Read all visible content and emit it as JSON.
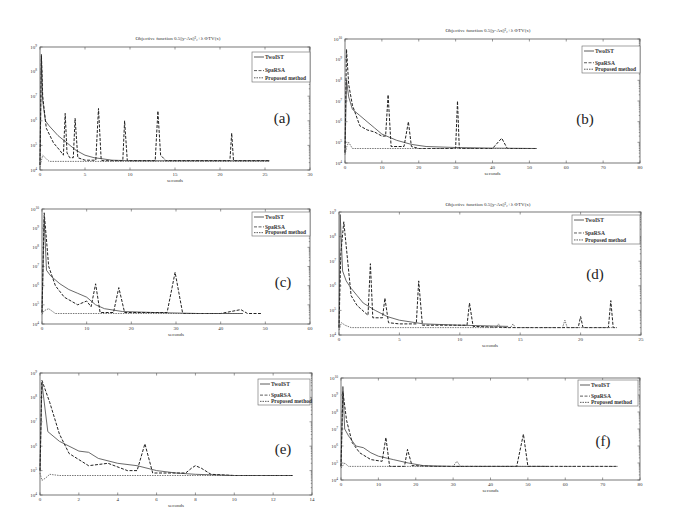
{
  "figure": {
    "legend_entries": [
      "TwoIST",
      "SpaRSA",
      "Proposed method"
    ]
  },
  "chart_data": [
    {
      "type": "line",
      "panel": "(a)",
      "title": "Objective function 0.5||y-Ax||²₂+λ ΦTV(x)",
      "xlabel": "seconds",
      "ylabel": "",
      "xlim": [
        0,
        30
      ],
      "ylim_exp": [
        4,
        9
      ],
      "yscale": "log",
      "xticks": [
        0,
        5,
        10,
        15,
        20,
        25,
        30
      ],
      "yticks_exp": [
        4,
        5,
        6,
        7,
        8,
        9
      ],
      "legend": "top-right",
      "series": [
        {
          "name": "TwoIST",
          "x": [
            0,
            0.15,
            0.3,
            0.6,
            1,
            2,
            3,
            4,
            5,
            6,
            7,
            8,
            10,
            14,
            20,
            25.5
          ],
          "y_exp": [
            4.2,
            8.6,
            6.8,
            6.0,
            5.8,
            5.4,
            5.1,
            4.8,
            4.6,
            4.5,
            4.45,
            4.4,
            4.38,
            4.38,
            4.38,
            4.38
          ]
        },
        {
          "name": "SpaRSA",
          "x": [
            0,
            0.15,
            0.3,
            0.7,
            1.5,
            2.2,
            2.6,
            2.8,
            3.0,
            3.3,
            3.7,
            3.9,
            4.2,
            5,
            6.2,
            6.5,
            6.8,
            7.0,
            9.2,
            9.4,
            9.7,
            12.8,
            13.1,
            13.4,
            14,
            21.1,
            21.3,
            21.5,
            25.5
          ],
          "y_exp": [
            4.2,
            8.7,
            7.0,
            5.7,
            5.1,
            4.8,
            4.6,
            6.3,
            4.7,
            4.5,
            4.5,
            6.1,
            4.5,
            4.4,
            4.4,
            6.5,
            4.4,
            4.38,
            4.38,
            6.0,
            4.38,
            4.38,
            6.4,
            4.6,
            4.38,
            4.38,
            5.5,
            4.38,
            4.38
          ]
        },
        {
          "name": "Proposed method",
          "x": [
            0,
            0.1,
            0.3,
            1,
            3,
            6,
            10,
            15,
            20,
            25.5
          ],
          "y_exp": [
            4.1,
            4.3,
            4.6,
            4.35,
            4.35,
            4.35,
            4.35,
            4.35,
            4.35,
            4.35
          ]
        }
      ]
    },
    {
      "type": "line",
      "panel": "(b)",
      "title": "Objective function 0.5||y-Ax||²₂+λ ΦTV(x)",
      "xlabel": "seconds",
      "ylabel": "",
      "xlim": [
        0,
        80
      ],
      "ylim_exp": [
        4,
        10
      ],
      "yscale": "log",
      "xticks": [
        0,
        10,
        20,
        30,
        40,
        50,
        60,
        70,
        80
      ],
      "yticks_exp": [
        4,
        5,
        6,
        7,
        8,
        9,
        10
      ],
      "legend": "top-right",
      "series": [
        {
          "name": "TwoIST",
          "x": [
            0,
            0.4,
            1,
            2,
            4,
            6,
            8,
            10,
            14,
            18,
            22,
            30,
            40,
            52
          ],
          "y_exp": [
            4.5,
            8.0,
            7.2,
            6.6,
            6.3,
            6.0,
            5.7,
            5.4,
            5.1,
            4.9,
            4.8,
            4.75,
            4.72,
            4.7
          ]
        },
        {
          "name": "SpaRSA",
          "x": [
            0,
            0.4,
            1,
            2,
            4,
            6,
            8,
            10,
            11,
            11.7,
            12.5,
            16,
            17.2,
            18,
            20,
            30,
            30.5,
            31,
            40,
            42.5,
            44,
            52
          ],
          "y_exp": [
            4.5,
            9.5,
            7.8,
            6.8,
            5.8,
            5.6,
            5.5,
            5.3,
            5.3,
            7.3,
            4.8,
            4.8,
            6.0,
            4.8,
            4.7,
            4.7,
            7.0,
            4.7,
            4.7,
            5.2,
            4.7,
            4.7
          ]
        },
        {
          "name": "Proposed method",
          "x": [
            0,
            0.5,
            1,
            2,
            5,
            10,
            20,
            30,
            40,
            52
          ],
          "y_exp": [
            4.4,
            4.8,
            5.0,
            4.7,
            4.7,
            4.7,
            4.7,
            4.7,
            4.7,
            4.7
          ]
        }
      ]
    },
    {
      "type": "line",
      "panel": "(c)",
      "title": "",
      "xlabel": "seconds",
      "ylabel": "",
      "xlim": [
        0,
        60
      ],
      "ylim_exp": [
        4,
        10
      ],
      "yscale": "log",
      "xticks": [
        0,
        10,
        20,
        30,
        40,
        50,
        60
      ],
      "yticks_exp": [
        4,
        5,
        6,
        7,
        8,
        9,
        10
      ],
      "legend": "top-right",
      "series": [
        {
          "name": "TwoIST",
          "x": [
            0,
            0.5,
            1,
            2,
            4,
            6,
            8,
            10,
            12,
            14,
            18,
            25,
            35,
            45
          ],
          "y_exp": [
            4.6,
            9.5,
            6.8,
            6.5,
            6.1,
            5.8,
            5.6,
            5.4,
            5.0,
            4.8,
            4.65,
            4.6,
            4.55,
            4.55
          ]
        },
        {
          "name": "SpaRSA",
          "x": [
            0,
            0.5,
            1.5,
            3,
            5,
            8,
            10,
            11,
            12,
            13,
            16,
            17.2,
            18.5,
            28,
            29.8,
            31.5,
            40,
            44.5,
            46,
            49
          ],
          "y_exp": [
            4.6,
            9.8,
            7.0,
            6.0,
            5.4,
            5.0,
            5.2,
            4.9,
            6.1,
            4.6,
            4.6,
            5.9,
            4.6,
            4.6,
            6.7,
            4.55,
            4.55,
            4.75,
            4.55,
            4.55
          ]
        },
        {
          "name": "Proposed method",
          "x": [
            0,
            0.5,
            1.5,
            3,
            10,
            20,
            30,
            40,
            45
          ],
          "y_exp": [
            4.5,
            4.7,
            4.8,
            4.55,
            4.55,
            4.55,
            4.55,
            4.55,
            4.55
          ]
        }
      ]
    },
    {
      "type": "line",
      "panel": "(d)",
      "title": "Objective function 0.5||y-Ax||²₂+λ ΦTV(x)",
      "xlabel": "seconds",
      "ylabel": "",
      "xlim": [
        0,
        25
      ],
      "ylim_exp": [
        4,
        9
      ],
      "yscale": "log",
      "xticks": [
        0,
        5,
        10,
        15,
        20,
        25
      ],
      "yticks_exp": [
        4,
        5,
        6,
        7,
        8,
        9
      ],
      "legend": "top-right",
      "series": [
        {
          "name": "TwoIST",
          "x": [
            0,
            0.1,
            0.3,
            0.6,
            1,
            1.5,
            2,
            3,
            4,
            5,
            7,
            10,
            14
          ],
          "y_exp": [
            4.3,
            8.9,
            6.6,
            6.2,
            5.9,
            5.6,
            5.3,
            5.0,
            4.75,
            4.6,
            4.45,
            4.4,
            4.35
          ]
        },
        {
          "name": "SpaRSA",
          "x": [
            0,
            0.15,
            0.4,
            1,
            1.5,
            2.4,
            2.6,
            2.8,
            3.6,
            3.8,
            4.1,
            5,
            6.4,
            6.6,
            6.9,
            10.6,
            10.8,
            11.1,
            14,
            19.8,
            20,
            20.2,
            22.3,
            22.5,
            22.7,
            23
          ],
          "y_exp": [
            4.3,
            7.3,
            8.6,
            5.6,
            5.2,
            4.8,
            6.9,
            4.7,
            4.7,
            5.5,
            4.5,
            4.45,
            4.45,
            6.2,
            4.4,
            4.4,
            5.3,
            4.35,
            4.3,
            4.3,
            4.75,
            4.3,
            4.3,
            5.4,
            4.3,
            4.3
          ]
        },
        {
          "name": "Proposed method",
          "x": [
            0,
            0.2,
            0.5,
            1,
            3,
            8,
            13,
            13.2,
            13.4,
            14.2,
            14.4,
            14.6,
            18.5,
            18.7,
            18.9,
            23
          ],
          "y_exp": [
            4.2,
            4.5,
            4.4,
            4.3,
            4.3,
            4.3,
            4.3,
            4.45,
            4.3,
            4.3,
            4.45,
            4.3,
            4.3,
            4.6,
            4.3,
            4.3
          ]
        }
      ]
    },
    {
      "type": "line",
      "panel": "(e)",
      "title": "",
      "xlabel": "seconds",
      "ylabel": "",
      "xlim": [
        0,
        14
      ],
      "ylim_exp": [
        4,
        9
      ],
      "yscale": "log",
      "xticks": [
        0,
        2,
        4,
        6,
        8,
        10,
        12,
        14
      ],
      "yticks_exp": [
        4,
        5,
        6,
        7,
        8,
        9
      ],
      "legend": "top-right",
      "series": [
        {
          "name": "TwoIST",
          "x": [
            0,
            0.1,
            0.4,
            1,
            2,
            2.5,
            3,
            4,
            5,
            6,
            7,
            8,
            10,
            13
          ],
          "y_exp": [
            5.0,
            8.6,
            6.6,
            6.2,
            5.8,
            5.75,
            5.5,
            5.3,
            5.2,
            5.0,
            4.9,
            4.85,
            4.8,
            4.8
          ]
        },
        {
          "name": "SpaRSA",
          "x": [
            0,
            0.1,
            0.5,
            1,
            1.5,
            2.5,
            3.5,
            4.5,
            5.0,
            5.4,
            5.8,
            7.5,
            7.8,
            8.0,
            8.3,
            8.8,
            10,
            13
          ],
          "y_exp": [
            5.0,
            8.7,
            7.8,
            6.5,
            5.7,
            5.2,
            5.3,
            5.0,
            5.0,
            6.1,
            4.9,
            4.9,
            5.1,
            5.2,
            5.1,
            4.85,
            4.8,
            4.8
          ]
        },
        {
          "name": "Proposed method",
          "x": [
            0,
            0.1,
            0.3,
            0.5,
            1,
            3,
            6,
            8,
            10,
            13
          ],
          "y_exp": [
            4.9,
            4.6,
            4.7,
            4.85,
            4.8,
            4.8,
            4.8,
            4.8,
            4.8,
            4.8
          ]
        }
      ]
    },
    {
      "type": "line",
      "panel": "(f)",
      "title": "",
      "xlabel": "seconds",
      "ylabel": "",
      "xlim": [
        0,
        80
      ],
      "ylim_exp": [
        4,
        10
      ],
      "yscale": "log",
      "xticks": [
        0,
        10,
        20,
        30,
        40,
        50,
        60,
        70,
        80
      ],
      "yticks_exp": [
        4,
        5,
        6,
        7,
        8,
        9,
        10
      ],
      "legend": "top-right",
      "series": [
        {
          "name": "TwoIST",
          "x": [
            0,
            0.5,
            1,
            2,
            4,
            6,
            8,
            10,
            14,
            18,
            22,
            30,
            40,
            55
          ],
          "y_exp": [
            4.8,
            9.5,
            7.0,
            6.6,
            6.0,
            5.9,
            5.6,
            5.4,
            5.2,
            5.0,
            4.85,
            4.8,
            4.8,
            4.8
          ]
        },
        {
          "name": "SpaRSA",
          "x": [
            0,
            0.5,
            1.5,
            3,
            5,
            8,
            11,
            12,
            13,
            17,
            17.8,
            19,
            25,
            30,
            47,
            48.8,
            50,
            60,
            74
          ],
          "y_exp": [
            4.8,
            9.2,
            7.5,
            6.2,
            5.6,
            5.2,
            5.1,
            6.5,
            4.8,
            4.8,
            5.8,
            4.85,
            4.8,
            4.8,
            4.8,
            6.7,
            4.8,
            4.8,
            4.8
          ]
        },
        {
          "name": "Proposed method",
          "x": [
            0,
            1,
            2,
            4,
            10,
            20,
            30,
            31,
            32,
            40,
            74
          ],
          "y_exp": [
            4.7,
            5.0,
            4.8,
            4.8,
            4.8,
            4.8,
            4.8,
            5.1,
            4.8,
            4.8,
            4.8
          ]
        }
      ]
    }
  ]
}
